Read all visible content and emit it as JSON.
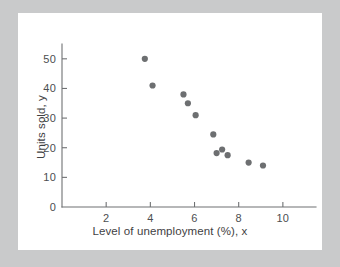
{
  "figure": {
    "background_color": "#c9cacb",
    "card_color": "#ffffff",
    "axis_color": "#6f7173",
    "point_color": "#6d6f71"
  },
  "chart_data": {
    "type": "scatter",
    "title": "",
    "xlabel": "Level of unemployment (%), x",
    "ylabel": "Units sold, y",
    "xlim": [
      0,
      11.5
    ],
    "ylim": [
      0,
      55
    ],
    "xticks": [
      2,
      4,
      6,
      8,
      10
    ],
    "yticks": [
      0,
      10,
      20,
      30,
      40,
      50
    ],
    "xtick_labels": [
      "2",
      "4",
      "6",
      "8",
      "10"
    ],
    "ytick_labels": [
      "0",
      "10",
      "20",
      "30",
      "40",
      "50"
    ],
    "grid": false,
    "legend": false,
    "legend_position": "none",
    "series": [
      {
        "name": "Units sold vs unemployment",
        "marker": "circle",
        "color": "#6d6f71",
        "points": [
          {
            "x": 3.75,
            "y": 50.0
          },
          {
            "x": 4.1,
            "y": 41.0
          },
          {
            "x": 5.5,
            "y": 38.0
          },
          {
            "x": 5.7,
            "y": 35.0
          },
          {
            "x": 6.05,
            "y": 31.0
          },
          {
            "x": 6.85,
            "y": 24.5
          },
          {
            "x": 7.0,
            "y": 18.2
          },
          {
            "x": 7.25,
            "y": 19.4
          },
          {
            "x": 7.5,
            "y": 17.5
          },
          {
            "x": 8.45,
            "y": 15.0
          },
          {
            "x": 9.1,
            "y": 14.0
          }
        ]
      }
    ]
  }
}
